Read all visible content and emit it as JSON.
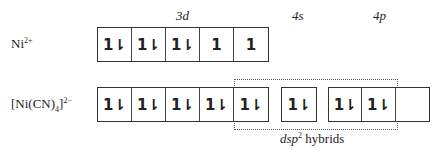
{
  "orbital_labels": {
    "d": "3d",
    "s": "4s",
    "p": "4p"
  },
  "rows": [
    {
      "species": "Ni",
      "charge": "2+",
      "d3": [
        "1⇂",
        "1⇂",
        "1⇂",
        "1",
        "1"
      ],
      "s4": [],
      "p4": []
    },
    {
      "species": "[Ni(CN)",
      "sub": "4",
      "close": "]",
      "charge": "2−",
      "d3": [
        "1⇂",
        "1⇂",
        "1⇂",
        "1⇂",
        "1⇂"
      ],
      "s4": [
        "1⇂"
      ],
      "p4": [
        "1⇂",
        "1⇂",
        ""
      ]
    }
  ],
  "hybrid_label": {
    "main": "dsp",
    "sup": "2",
    "rest": " hybrids"
  }
}
